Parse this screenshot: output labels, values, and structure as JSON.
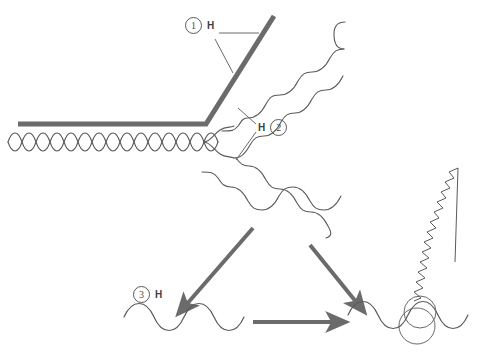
{
  "diagram": {
    "background_color": "#ffffff",
    "width": 486,
    "height": 353,
    "colors": {
      "thick_stroke": "#6b6b6b",
      "thin_stroke": "#5a5a5a",
      "arrow": "#6b6b6b",
      "label_text": "#4a4a4a",
      "circle_outline": "#5a5a5a"
    },
    "labels": [
      {
        "id": "label-1",
        "number": "1",
        "tag": "H",
        "order": "number-then-tag",
        "x": 185,
        "y": 17,
        "leaders": 2,
        "points_to": "thick-bent-beam"
      },
      {
        "id": "label-2",
        "number": "2",
        "tag": "H",
        "order": "tag-then-number",
        "x": 258,
        "y": 119,
        "leaders": 2,
        "points_to": "diagonal-square-waves"
      },
      {
        "id": "label-3",
        "number": "3",
        "tag": "H",
        "order": "number-then-tag",
        "x": 133,
        "y": 286,
        "leaders": 0,
        "points_to": "lower-left-sine-wave"
      }
    ],
    "elements": [
      {
        "name": "thick-bent-beam",
        "kind": "polyline",
        "stroke_width": 5,
        "description": "Thick gray line running horizontally then bending up to the right at a sharp elbow"
      },
      {
        "name": "braided-double-wave",
        "kind": "braid",
        "description": "Two interleaved anti-phase sine waves forming an X / helix weave along the horizontal axis"
      },
      {
        "name": "diagonal-square-wave-upper",
        "kind": "square-wave",
        "description": "Rounded square wave ascending diagonally toward the upper right"
      },
      {
        "name": "diagonal-square-wave-lower",
        "kind": "square-wave",
        "description": "Rounded square wave descending diagonally toward the lower right"
      },
      {
        "name": "arrow-down-left",
        "kind": "arrow",
        "direction": "down-left",
        "description": "Thick arrow from the wave junction down-left to the lower sine wave"
      },
      {
        "name": "arrow-down-right",
        "kind": "arrow",
        "direction": "down-right",
        "description": "Thick arrow from the wave junction down-right to the second sine wave"
      },
      {
        "name": "arrow-right",
        "kind": "arrow",
        "direction": "right",
        "description": "Thick horizontal arrow between the two lower sine waves"
      },
      {
        "name": "lower-left-sine-wave",
        "kind": "sine",
        "description": "Smooth sine wave at the bottom left"
      },
      {
        "name": "lower-right-sine-wave",
        "kind": "sine",
        "description": "Smooth sine wave at the bottom right"
      },
      {
        "name": "highlight-circles",
        "kind": "circles",
        "count": 2,
        "description": "Two overlapping thin circles highlighting a trough of the lower right sine wave"
      },
      {
        "name": "emission-zigzag",
        "kind": "zigzag",
        "description": "High frequency zigzag emanating up and to the right from the highlighted trough"
      }
    ]
  }
}
